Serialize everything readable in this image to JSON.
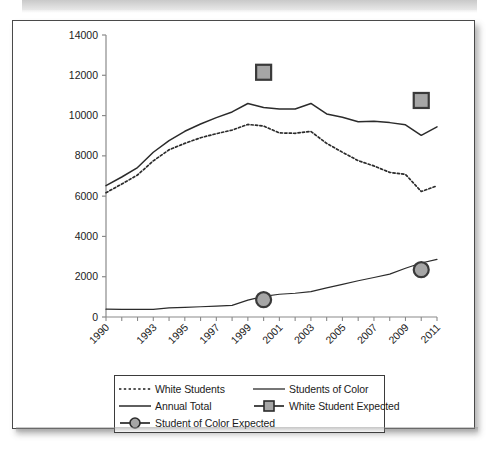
{
  "figure": {
    "background_color": "#ffffff",
    "frame_color": "#4a4a4a",
    "line_color": "#2b2b2b",
    "marker_fill": "#a6a6a6",
    "marker_stroke": "#3a3a3a"
  },
  "chart_data": {
    "type": "line",
    "title": "",
    "xlabel": "",
    "ylabel": "",
    "x": [
      1990,
      1991,
      1992,
      1993,
      1994,
      1995,
      1996,
      1997,
      1998,
      1999,
      2000,
      2001,
      2002,
      2003,
      2004,
      2005,
      2006,
      2007,
      2008,
      2009,
      2010,
      2011
    ],
    "xtick_labels": [
      "1990",
      "1993",
      "1995",
      "1997",
      "1999",
      "2001",
      "2003",
      "2005",
      "2007",
      "2009",
      "2011"
    ],
    "xtick_values": [
      1990,
      1993,
      1995,
      1997,
      1999,
      2001,
      2003,
      2005,
      2007,
      2009,
      2011
    ],
    "ytick_labels": [
      "0",
      "2000",
      "4000",
      "6000",
      "8000",
      "10000",
      "12000",
      "14000"
    ],
    "ytick_values": [
      0,
      2000,
      4000,
      6000,
      8000,
      10000,
      12000,
      14000
    ],
    "ylim": [
      0,
      14000
    ],
    "xlim": [
      1990,
      2011
    ],
    "grid": false,
    "legend_position": "below-axes",
    "series": [
      {
        "name": "White Students",
        "style": "dotted",
        "values": [
          6170,
          6600,
          7050,
          7750,
          8300,
          8620,
          8900,
          9100,
          9280,
          9560,
          9480,
          9140,
          9120,
          9210,
          8620,
          8180,
          7760,
          7500,
          7180,
          7080,
          6230,
          6510
        ]
      },
      {
        "name": "Annual Total",
        "style": "solid",
        "values": [
          6520,
          6950,
          7420,
          8180,
          8760,
          9220,
          9580,
          9900,
          10180,
          10600,
          10400,
          10330,
          10330,
          10600,
          10080,
          9920,
          9690,
          9720,
          9650,
          9540,
          9020,
          9440
        ]
      },
      {
        "name": "Students of Color",
        "style": "solid-thin",
        "values": [
          390,
          380,
          375,
          380,
          450,
          480,
          510,
          540,
          580,
          840,
          1020,
          1130,
          1180,
          1260,
          1450,
          1620,
          1800,
          1960,
          2130,
          2420,
          2680,
          2860
        ]
      }
    ],
    "markers": [
      {
        "name": "White Student Expected",
        "shape": "square",
        "x": 2000,
        "y": 12150,
        "fill": "#a6a6a6"
      },
      {
        "name": "White Student Expected",
        "shape": "square",
        "x": 2010,
        "y": 10750,
        "fill": "#a6a6a6"
      },
      {
        "name": "Student of Color Expected",
        "shape": "circle",
        "x": 2000,
        "y": 860,
        "fill": "#a6a6a6"
      },
      {
        "name": "Student of Color Expected",
        "shape": "circle",
        "x": 2010,
        "y": 2350,
        "fill": "#a6a6a6"
      }
    ]
  },
  "legend": {
    "items": [
      {
        "label": "White Students",
        "key": "dotted-line"
      },
      {
        "label": "Students of Color",
        "key": "solid-line"
      },
      {
        "label": "Annual Total",
        "key": "solid-line"
      },
      {
        "label": "White Student Expected",
        "key": "square-marker-line"
      },
      {
        "label": "Student of Color Expected",
        "key": "circle-marker-line"
      }
    ]
  }
}
